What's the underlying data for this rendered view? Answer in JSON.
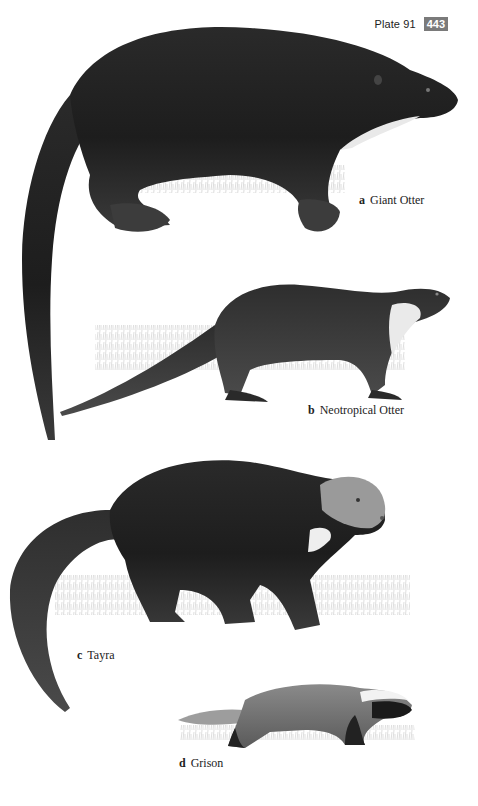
{
  "header": {
    "plate_label": "Plate 91",
    "page_number": "443",
    "page_number_bg": "#7a7a7a"
  },
  "figures": [
    {
      "letter": "a",
      "name": "Giant Otter",
      "icon": "giant-otter-illustration"
    },
    {
      "letter": "b",
      "name": "Neotropical Otter",
      "icon": "neotropical-otter-illustration"
    },
    {
      "letter": "c",
      "name": "Tayra",
      "icon": "tayra-illustration"
    },
    {
      "letter": "d",
      "name": "Grison",
      "icon": "grison-illustration"
    }
  ],
  "colors": {
    "ink_dark": "#1c1c1c",
    "ink_mid": "#3a3a3a",
    "fur_light": "#e8e8e8",
    "grass": "#c8c8c8"
  }
}
